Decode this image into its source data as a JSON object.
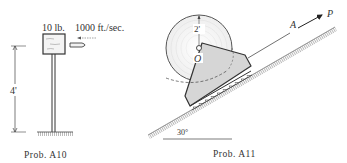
{
  "prob_a10": {
    "caption": "Prob. A10",
    "weight_label": "10 lb.",
    "velocity_label": "1000 ft./sec.",
    "height_label": "4'"
  },
  "prob_a11": {
    "caption": "Prob. A11",
    "radius_label": "2'",
    "center_label": "O",
    "point_label": "A",
    "force_label": "P",
    "angle_label": "30°"
  },
  "colors": {
    "ink": "#333333",
    "fill_gray": "#d4d4d4",
    "hatch": "#888888"
  }
}
